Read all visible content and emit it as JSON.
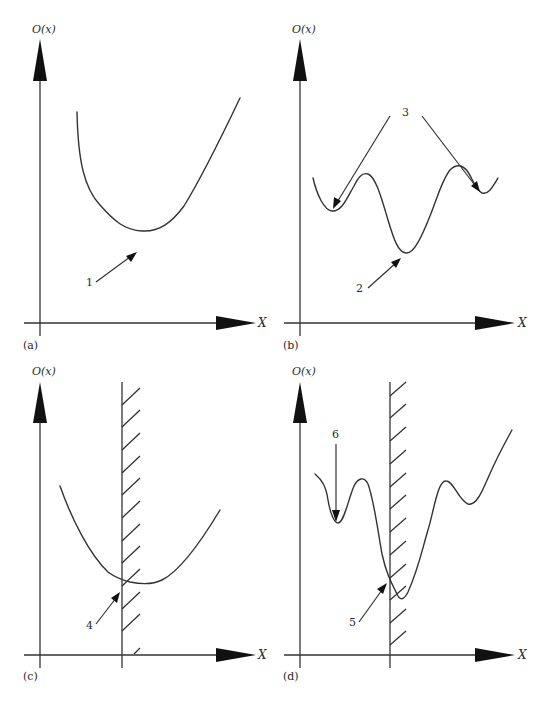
{
  "figure": {
    "panels": [
      {
        "id": "a",
        "tag": "(a)",
        "y_axis_label": "O(x)",
        "x_axis_label": "X",
        "description": "Unimodal objective function",
        "annotations": [
          {
            "label": "1",
            "meaning": "global minimum"
          }
        ]
      },
      {
        "id": "b",
        "tag": "(b)",
        "y_axis_label": "O(x)",
        "x_axis_label": "X",
        "description": "Multimodal objective function",
        "annotations": [
          {
            "label": "2",
            "meaning": "global minimum"
          },
          {
            "label": "3",
            "meaning": "local minima"
          }
        ]
      },
      {
        "id": "c",
        "tag": "(c)",
        "y_axis_label": "O(x)",
        "x_axis_label": "X",
        "description": "Unimodal function with constraint boundary",
        "annotations": [
          {
            "label": "4",
            "meaning": "constrained minimum at boundary"
          }
        ]
      },
      {
        "id": "d",
        "tag": "(d)",
        "y_axis_label": "O(x)",
        "x_axis_label": "X",
        "description": "Multimodal function with constraint boundary",
        "annotations": [
          {
            "label": "5",
            "meaning": "constrained minimum at boundary"
          },
          {
            "label": "6",
            "meaning": "local minimum"
          }
        ]
      }
    ]
  },
  "colors": {
    "line": "#333333",
    "arrowhead": "#111111",
    "background": "#ffffff"
  }
}
